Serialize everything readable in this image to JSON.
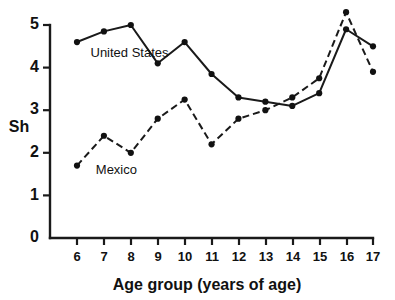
{
  "chart_data": {
    "type": "line",
    "title": "",
    "subtitle": "",
    "xlabel": "Age group (years of age)",
    "ylabel": "Sh",
    "x": [
      6,
      7,
      8,
      9,
      10,
      11,
      12,
      13,
      14,
      15,
      16,
      17
    ],
    "xtick_labels": [
      "6",
      "7",
      "8",
      "9",
      "10",
      "11",
      "12",
      "13",
      "14",
      "15",
      "16",
      "17"
    ],
    "ytick_labels": [
      "0",
      "1",
      "2",
      "3",
      "4",
      "5"
    ],
    "ytick_values": [
      0,
      1,
      2,
      3,
      4,
      5
    ],
    "xlim": [
      5.5,
      17.5
    ],
    "ylim": [
      0,
      5.5
    ],
    "grid": false,
    "legend_position": "inline-annotations",
    "series": [
      {
        "name": "United States",
        "style": "solid",
        "marker": "filled-circle",
        "color": "#111111",
        "values": [
          4.6,
          4.85,
          5.0,
          4.1,
          4.6,
          3.85,
          3.3,
          3.2,
          3.1,
          3.4,
          4.9,
          4.5
        ]
      },
      {
        "name": "Mexico",
        "style": "dashed",
        "marker": "filled-circle",
        "color": "#111111",
        "values": [
          1.7,
          2.4,
          2.0,
          2.8,
          3.25,
          2.2,
          2.8,
          3.0,
          3.3,
          3.75,
          5.3,
          3.9
        ]
      }
    ],
    "annotations": [
      {
        "text": "United States",
        "x": 6.5,
        "y": 4.25
      },
      {
        "text": "Mexico",
        "x": 6.7,
        "y": 1.5
      }
    ]
  },
  "colors": {
    "ink": "#111111",
    "axis": "#1a1a1a",
    "background": "#ffffff"
  }
}
